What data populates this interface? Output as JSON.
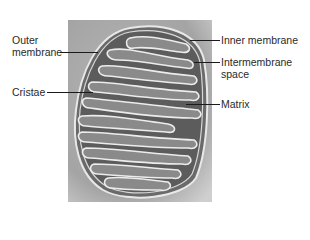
{
  "figure": {
    "labels": {
      "outer_membrane_line1": "Outer",
      "outer_membrane_line2": "membrane",
      "cristae": "Cristae",
      "inner_membrane": "Inner membrane",
      "intermembrane_line1": "Intermembrane",
      "intermembrane_line2": "space",
      "matrix": "Matrix"
    },
    "colors": {
      "background": "#ffffff",
      "photo_gray": "#a8a8a8",
      "membrane_highlight": "#e6e6e6",
      "matrix_dark": "#5e5e5e",
      "leader_line": "#1a1a1a"
    }
  }
}
